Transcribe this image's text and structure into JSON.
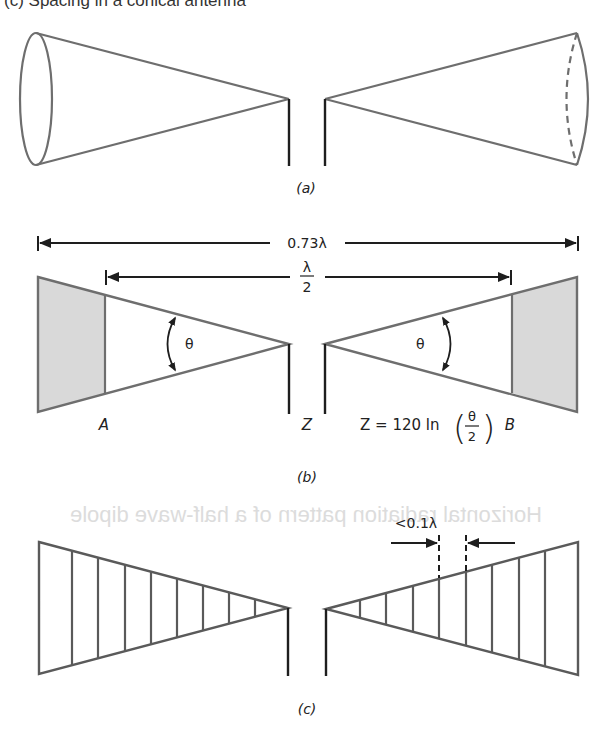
{
  "header": {
    "caption_cutoff": "(c) Spacing in a conical antenna"
  },
  "bleed_through": {
    "text": "Horizontal radiation pattern of a half-wave dipole"
  },
  "figure": {
    "part_a": {
      "label": "(a)",
      "description": "Biconical antenna: two cones fed at apexes"
    },
    "part_b": {
      "label": "(b)",
      "overall_length": "0.73λ",
      "inner_length_numerator": "λ",
      "inner_length_denominator": "2",
      "angle_symbol": "θ",
      "left_point": "A",
      "feed_point": "Z",
      "right_point": "B",
      "impedance_formula_lhs": "Z = 120 ln",
      "impedance_formula_num": "θ",
      "impedance_formula_den": "2"
    },
    "part_c": {
      "label": "(c)",
      "spacing_label": "<0.1λ",
      "element_count_each_side": 8
    }
  },
  "colors": {
    "outline": "#6e6e6e",
    "dark_line": "#1e1e1e",
    "shade": "#d9d9d9",
    "bleed": "#dcdcdc"
  }
}
